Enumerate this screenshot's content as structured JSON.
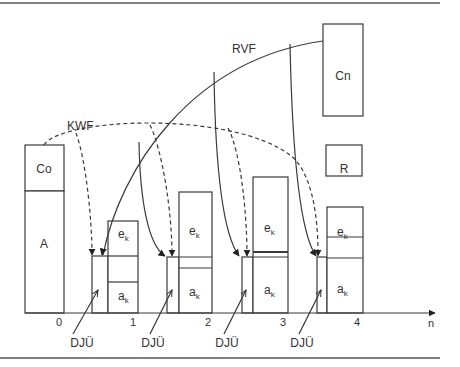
{
  "diagram": {
    "curve_labels": {
      "rvf": "RVF",
      "kwf": "KWF"
    },
    "blocks": {
      "co": "Co",
      "a": "A",
      "cn": "Cn",
      "r": "R"
    },
    "period_bars": [
      {
        "e_label": "e",
        "e_sub": "k",
        "a_label": "a",
        "a_sub": "k"
      },
      {
        "e_label": "e",
        "e_sub": "k",
        "a_label": "a",
        "a_sub": "k"
      },
      {
        "e_label": "e",
        "e_sub": "k",
        "a_label": "a",
        "a_sub": "k"
      },
      {
        "e_label": "e",
        "e_sub": "k",
        "a_label": "a",
        "a_sub": "k"
      }
    ],
    "djue_labels": [
      "DJÜ",
      "DJÜ",
      "DJÜ",
      "DJÜ"
    ],
    "axis": {
      "ticks": [
        "0",
        "1",
        "2",
        "3",
        "4"
      ],
      "variable": "n"
    },
    "colors": {
      "line": "#3a3a3a",
      "rule": "#555555",
      "background": "#ffffff"
    }
  }
}
